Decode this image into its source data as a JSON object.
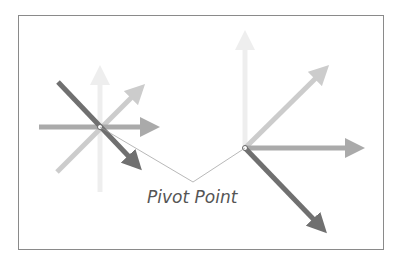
{
  "diagram": {
    "label": "Pivot Point",
    "colors": {
      "border": "#8a8a8a",
      "arrow_lightest": "#eeeeee",
      "arrow_light": "#cccccc",
      "arrow_mid": "#aaaaaa",
      "arrow_dark": "#707070",
      "leader_line": "#999999"
    },
    "pivots": [
      {
        "name": "left-pivot",
        "x": 100,
        "y": 127
      },
      {
        "name": "right-pivot",
        "x": 245,
        "y": 148
      }
    ]
  }
}
